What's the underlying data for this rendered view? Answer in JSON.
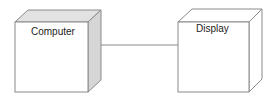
{
  "diagram": {
    "type": "UML deployment diagram",
    "nodes": [
      {
        "id": "computer",
        "label": "Computer",
        "side_shade": "#d6d6d6"
      },
      {
        "id": "display",
        "label": "Display",
        "side_shade": "#ffffff"
      }
    ],
    "connections": [
      {
        "from": "computer",
        "to": "display",
        "style": "solid"
      }
    ],
    "colors": {
      "stroke": "#8a8a8a",
      "top_face": "#e2e2e2",
      "front_face": "#ffffff"
    }
  }
}
